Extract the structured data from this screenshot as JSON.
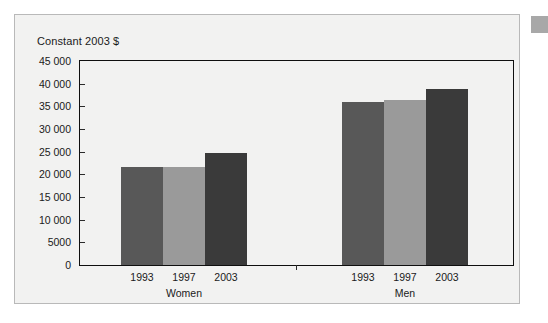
{
  "figure": {
    "title": "Constant 2003 $"
  },
  "chart_data": {
    "type": "bar",
    "title": "Constant 2003 $",
    "xlabel": "",
    "ylabel": "Constant 2003 $",
    "ylim": [
      0,
      45000
    ],
    "ytick_labels": [
      "45 000",
      "40 000",
      "35 000",
      "30 000",
      "25 000",
      "20 000",
      "15 000",
      "10 000",
      "5000",
      "0"
    ],
    "ytick_values": [
      45000,
      40000,
      35000,
      30000,
      25000,
      20000,
      15000,
      10000,
      5000,
      0
    ],
    "grid": false,
    "legend": "none",
    "groups": [
      "Women",
      "Men"
    ],
    "categories": [
      "1993",
      "1997",
      "2003"
    ],
    "series": [
      {
        "name": "Women",
        "values": [
          21600,
          21600,
          24600
        ]
      },
      {
        "name": "Men",
        "values": [
          36000,
          36300,
          38900
        ]
      }
    ],
    "bar_colors": [
      "#585858",
      "#9a9a9a",
      "#3a3a3a"
    ]
  },
  "axis": {
    "ticks": [
      {
        "label": "45 000",
        "value": 45000
      },
      {
        "label": "40 000",
        "value": 40000
      },
      {
        "label": "35 000",
        "value": 35000
      },
      {
        "label": "30 000",
        "value": 30000
      },
      {
        "label": "25 000",
        "value": 25000
      },
      {
        "label": "20 000",
        "value": 20000
      },
      {
        "label": "15 000",
        "value": 15000
      },
      {
        "label": "10 000",
        "value": 10000
      },
      {
        "label": "5000",
        "value": 5000
      },
      {
        "label": "0",
        "value": 0
      }
    ]
  },
  "groups": [
    {
      "name": "Women",
      "bars": [
        {
          "label": "1993",
          "value": 21600,
          "color": "#585858"
        },
        {
          "label": "1997",
          "value": 21600,
          "color": "#9a9a9a"
        },
        {
          "label": "2003",
          "value": 24600,
          "color": "#3a3a3a"
        }
      ]
    },
    {
      "name": "Men",
      "bars": [
        {
          "label": "1993",
          "value": 36000,
          "color": "#585858"
        },
        {
          "label": "1997",
          "value": 36300,
          "color": "#9a9a9a"
        },
        {
          "label": "2003",
          "value": 38900,
          "color": "#3a3a3a"
        }
      ]
    }
  ]
}
